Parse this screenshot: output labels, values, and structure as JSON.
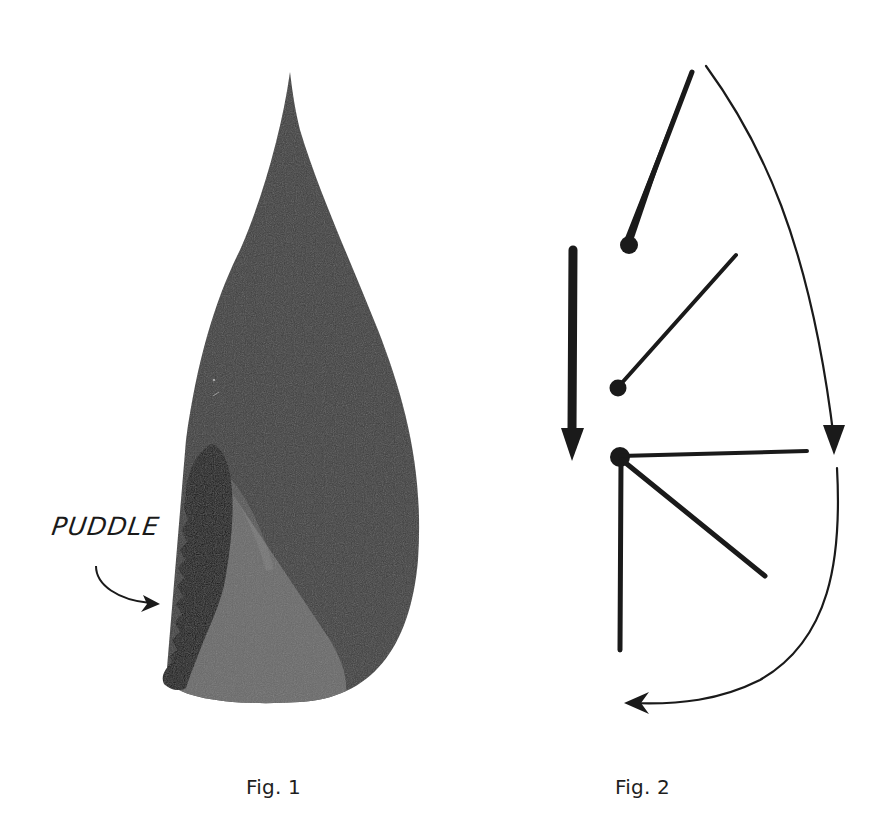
{
  "figures": [
    {
      "id": "fig1",
      "caption": "Fig. 1",
      "description": "Teardrop-shaped dark wash with a darker puddle along the lower-left edge",
      "annotation": {
        "label": "PUDDLE",
        "arrow": "curved arrow pointing right toward puddle edge"
      },
      "colors": {
        "body": "#3d3d3d",
        "lighter_band": "#6e6e6e",
        "puddle": "#141414"
      }
    },
    {
      "id": "fig2",
      "caption": "Fig. 2",
      "description": "Stroke-direction diagram: a bold downward arrow, three dot-anchored strokes, a fan of lines, and a curved arrow tracing the teardrop outline",
      "colors": {
        "ink": "#1a1a1a"
      }
    }
  ]
}
